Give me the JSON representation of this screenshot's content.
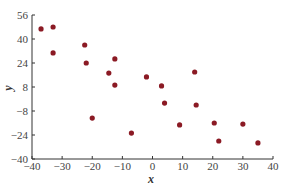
{
  "chart_data": {
    "type": "scatter",
    "title": "",
    "xlabel": "x",
    "ylabel": "y",
    "xlim": [
      -40,
      40
    ],
    "ylim": [
      -40,
      56
    ],
    "xticks": [
      -40,
      -30,
      -20,
      -10,
      0,
      10,
      20,
      30,
      40
    ],
    "yticks": [
      -40,
      -24,
      -8,
      8,
      24,
      40,
      56
    ],
    "grid": false,
    "legend": null,
    "marker_color": "#8b1a24",
    "points": [
      {
        "x": -37,
        "y": 46.7
      },
      {
        "x": -33,
        "y": 48
      },
      {
        "x": -33,
        "y": 30.7
      },
      {
        "x": -22.5,
        "y": 36
      },
      {
        "x": -22,
        "y": 24
      },
      {
        "x": -12.5,
        "y": 26.7
      },
      {
        "x": -14.5,
        "y": 17.3
      },
      {
        "x": -12.5,
        "y": 9.3
      },
      {
        "x": -20,
        "y": -12.7
      },
      {
        "x": -7,
        "y": -22.7
      },
      {
        "x": -2,
        "y": 14.7
      },
      {
        "x": 3,
        "y": 8.7
      },
      {
        "x": 4,
        "y": -2.7
      },
      {
        "x": 14,
        "y": 18
      },
      {
        "x": 14.5,
        "y": -4
      },
      {
        "x": 9,
        "y": -17.3
      },
      {
        "x": 20.5,
        "y": -16
      },
      {
        "x": 22,
        "y": -28
      },
      {
        "x": 30,
        "y": -16.7
      },
      {
        "x": 35,
        "y": -29.3
      }
    ]
  }
}
